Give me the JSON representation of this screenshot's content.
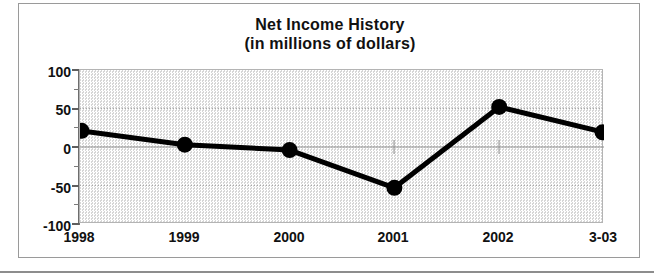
{
  "chart_data": {
    "type": "line",
    "title": "Net Income History",
    "subtitle": "(in millions of dollars)",
    "xlabel": "",
    "ylabel": "",
    "categories": [
      "1998",
      "1999",
      "2000",
      "2001",
      "2002",
      "3-03"
    ],
    "values": [
      21,
      3,
      -4,
      -53,
      52,
      19
    ],
    "series": [
      {
        "name": "Net Income",
        "values": [
          21,
          3,
          -4,
          -53,
          52,
          19
        ]
      }
    ],
    "ylim": [
      -100,
      100
    ],
    "ytick_labels": [
      "100",
      "50",
      "0",
      "-50",
      "-100"
    ],
    "ytick_values": [
      100,
      50,
      0,
      -50,
      -100
    ],
    "yminor_step": 25,
    "grid": true,
    "legend": false,
    "legend_position": "none",
    "line_color": "#000000",
    "marker": "circle",
    "marker_color": "#000000",
    "plot_background": "#e8e8e8"
  },
  "axes": {
    "y_ticks": [
      {
        "label": "100",
        "value": 100
      },
      {
        "label": "50",
        "value": 50
      },
      {
        "label": "0",
        "value": 0
      },
      {
        "label": "-50",
        "value": -50
      },
      {
        "label": "-100",
        "value": -100
      }
    ],
    "x_ticks": [
      {
        "label": "1998"
      },
      {
        "label": "1999"
      },
      {
        "label": "2000"
      },
      {
        "label": "2001"
      },
      {
        "label": "2002"
      },
      {
        "label": "3-03"
      }
    ]
  }
}
